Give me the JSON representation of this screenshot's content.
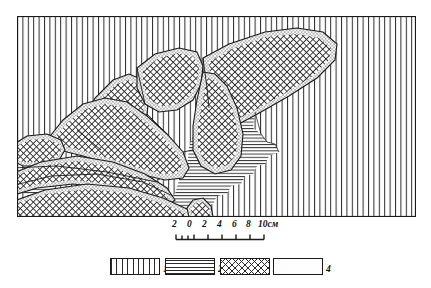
{
  "figure": {
    "kind": "geological-cross-section",
    "frame": {
      "x": 17,
      "y": 16,
      "width": 399,
      "height": 201,
      "border_color": "#1a1a1a"
    },
    "background_pattern": "vertical-lines",
    "patterns": {
      "vertical_lines": {
        "name": "vertical-lines",
        "color": "#2a2a2a",
        "spacing_px": 5.4
      },
      "horizontal_lines": {
        "name": "horizontal-lines",
        "color": "#2a2a2a",
        "spacing_px": 3.2
      },
      "cross_hatch": {
        "name": "cross-hatch",
        "color": "#2a2a2a",
        "spacing_px": 4.6
      },
      "stipple": {
        "name": "stipple-dots",
        "color": "#333333",
        "spacing_px": 3.4
      }
    }
  },
  "scale": {
    "ticks": [
      "2",
      "0",
      "2",
      "4",
      "6",
      "8",
      "10см"
    ],
    "tick_x": [
      0,
      20,
      40,
      60,
      80,
      100,
      120
    ],
    "unit": "см",
    "bar": {
      "x0": 26,
      "x1": 114,
      "y": 8,
      "segments": 7
    }
  },
  "legend": {
    "items": [
      {
        "label": "1",
        "pattern": "vertical-lines",
        "x": 110
      },
      {
        "label": "2",
        "pattern": "horizontal-lines",
        "x": 165
      },
      {
        "label": "3",
        "pattern": "cross-hatch",
        "x": 220
      },
      {
        "label": "4",
        "pattern": "stipple-dots",
        "x": 273
      }
    ]
  },
  "colors": {
    "ink": "#1a1a1a",
    "hatch": "#2a2a2a",
    "paper": "#ffffff"
  }
}
